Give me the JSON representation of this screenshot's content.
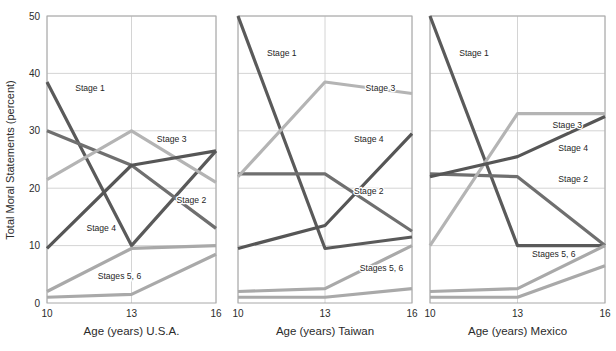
{
  "figure": {
    "background": "#ffffff",
    "ylabel": "Total Moral Statements (percent)",
    "y_ticks": [
      "0",
      "10",
      "20",
      "30",
      "40",
      "50"
    ],
    "x_ticks": [
      "10",
      "13",
      "16"
    ],
    "grid_color": "#cfcfcf",
    "axis_color": "#a8a8a8"
  },
  "series_styles": [
    {
      "key": "stage1",
      "label": "Stage 1",
      "color": "#5a5a5a",
      "width": 3.2
    },
    {
      "key": "stage2",
      "label": "Stage 2",
      "color": "#6f6f6f",
      "width": 3.2
    },
    {
      "key": "stage3",
      "label": "Stage 3",
      "color": "#b4b4b4",
      "width": 3.2
    },
    {
      "key": "stage4",
      "label": "Stage 4",
      "color": "#565656",
      "width": 3.2
    },
    {
      "key": "stage56",
      "label": "Stages 5, 6",
      "color": "#a9a9a9",
      "width": 3.2
    }
  ],
  "chart_data": [
    {
      "type": "line",
      "title": "",
      "xlabel": "Age (years) U.S.A.",
      "ylabel": "Total Moral Statements (percent)",
      "x": [
        10,
        13,
        16
      ],
      "xlim": [
        10,
        16
      ],
      "ylim": [
        0,
        50
      ],
      "yticks": [
        0,
        10,
        20,
        30,
        40,
        50
      ],
      "xticks": [
        10,
        13,
        16
      ],
      "grid": true,
      "legend": "inline-annotations",
      "series": [
        {
          "name": "Stage 1",
          "values": [
            38.5,
            10,
            26.5
          ],
          "label_pos": [
            11.0,
            37.0
          ]
        },
        {
          "name": "Stage 2",
          "values": [
            30,
            24,
            13
          ],
          "label_pos": [
            14.6,
            17.5
          ]
        },
        {
          "name": "Stage 3",
          "values": [
            21.5,
            30,
            21
          ],
          "label_pos": [
            13.9,
            28.0
          ]
        },
        {
          "name": "Stage 4",
          "values": [
            9.5,
            24,
            26.5
          ],
          "label_pos": [
            11.4,
            12.5
          ]
        },
        {
          "name": "Stages 5, 6",
          "values": [
            2,
            9.5,
            10
          ],
          "label_pos": [
            11.8,
            4.2
          ]
        },
        {
          "name": "Stages 5, 6 (lower)",
          "values": [
            1,
            1.5,
            8.5
          ],
          "label_pos": null
        }
      ]
    },
    {
      "type": "line",
      "title": "",
      "xlabel": "Age (years) Taiwan",
      "ylabel": "",
      "x": [
        10,
        13,
        16
      ],
      "xlim": [
        10,
        16
      ],
      "ylim": [
        0,
        50
      ],
      "yticks": [
        0,
        10,
        20,
        30,
        40,
        50
      ],
      "xticks": [
        10,
        13,
        16
      ],
      "grid": true,
      "legend": "inline-annotations",
      "series": [
        {
          "name": "Stage 1",
          "values": [
            50,
            9.5,
            11.5
          ],
          "label_pos": [
            11.0,
            43.0
          ]
        },
        {
          "name": "Stage 2",
          "values": [
            22.5,
            22.5,
            12.5
          ],
          "label_pos": [
            14.0,
            19.0
          ]
        },
        {
          "name": "Stage 3",
          "values": [
            22,
            38.5,
            36.5
          ],
          "label_pos": [
            14.4,
            37.0
          ]
        },
        {
          "name": "Stage 4",
          "values": [
            9.5,
            13.5,
            29.5
          ],
          "label_pos": [
            14.0,
            28.0
          ]
        },
        {
          "name": "Stages 5, 6",
          "values": [
            2,
            2.5,
            10
          ],
          "label_pos": [
            14.2,
            5.5
          ]
        },
        {
          "name": "Stages 5, 6 (lower)",
          "values": [
            1,
            1,
            2.5
          ],
          "label_pos": null
        }
      ]
    },
    {
      "type": "line",
      "title": "",
      "xlabel": "Age (years) Mexico",
      "ylabel": "",
      "x": [
        10,
        13,
        16
      ],
      "xlim": [
        10,
        16
      ],
      "ylim": [
        0,
        50
      ],
      "yticks": [
        0,
        10,
        20,
        30,
        40,
        50
      ],
      "xticks": [
        10,
        13,
        16
      ],
      "grid": true,
      "legend": "inline-annotations",
      "series": [
        {
          "name": "Stage 1",
          "values": [
            50,
            10,
            10
          ],
          "label_pos": [
            11.0,
            43.0
          ]
        },
        {
          "name": "Stage 2",
          "values": [
            22.5,
            22,
            10
          ],
          "label_pos": [
            14.4,
            21.0
          ]
        },
        {
          "name": "Stage 3",
          "values": [
            10,
            33,
            33
          ],
          "label_pos": [
            14.2,
            30.5
          ]
        },
        {
          "name": "Stage 4",
          "values": [
            22,
            25.5,
            32.5
          ],
          "label_pos": [
            14.4,
            26.5
          ]
        },
        {
          "name": "Stages 5, 6",
          "values": [
            2,
            2.5,
            10
          ],
          "label_pos": [
            13.5,
            8.0
          ]
        },
        {
          "name": "Stages 5, 6 (lower)",
          "values": [
            1,
            1,
            6.5
          ],
          "label_pos": null
        }
      ]
    }
  ]
}
